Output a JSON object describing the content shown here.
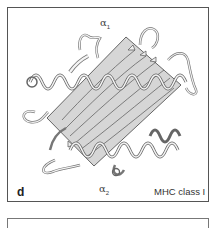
{
  "figure": {
    "panel_letter": "d",
    "caption": "MHC class I",
    "labels": {
      "alpha1": {
        "symbol": "α",
        "subscript": "1"
      },
      "alpha2": {
        "symbol": "α",
        "subscript": "2"
      }
    },
    "elements": {
      "platform": "beta-sheet platform (shaded parallelogram)",
      "helices": [
        "alpha1 helix",
        "alpha2 helix"
      ],
      "strands": "beta strands with arrows"
    },
    "colors": {
      "border": "#555555",
      "ribbon_fill": "#f2f2f2",
      "ribbon_stroke": "#666666",
      "platform_fill": "#d9d9d9",
      "text": "#333333"
    }
  }
}
